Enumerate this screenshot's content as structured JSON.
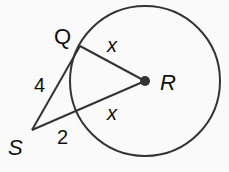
{
  "diagram": {
    "circle": {
      "center_label": "R",
      "cx": 145,
      "cy": 81,
      "r": 75
    },
    "points": {
      "Q": {
        "label": "Q",
        "x": 80,
        "y": 46
      },
      "R": {
        "label": "R",
        "x": 145,
        "y": 81
      },
      "S": {
        "label": "S",
        "x": 32,
        "y": 130
      }
    },
    "segments": [
      {
        "from": "S",
        "to": "Q",
        "label": "4",
        "desc": "tangent"
      },
      {
        "from": "Q",
        "to": "R",
        "label": "x",
        "desc": "radius"
      },
      {
        "from": "S",
        "to": "R",
        "label": "",
        "desc": "secant through center"
      }
    ],
    "labels": {
      "q": "Q",
      "r": "R",
      "s": "S",
      "sq_length": "4",
      "qr_length": "x",
      "radius_lower": "x",
      "external_segment": "2"
    },
    "colors": {
      "stroke": "#333333",
      "text": "#111111",
      "background": "#fafafa"
    }
  }
}
